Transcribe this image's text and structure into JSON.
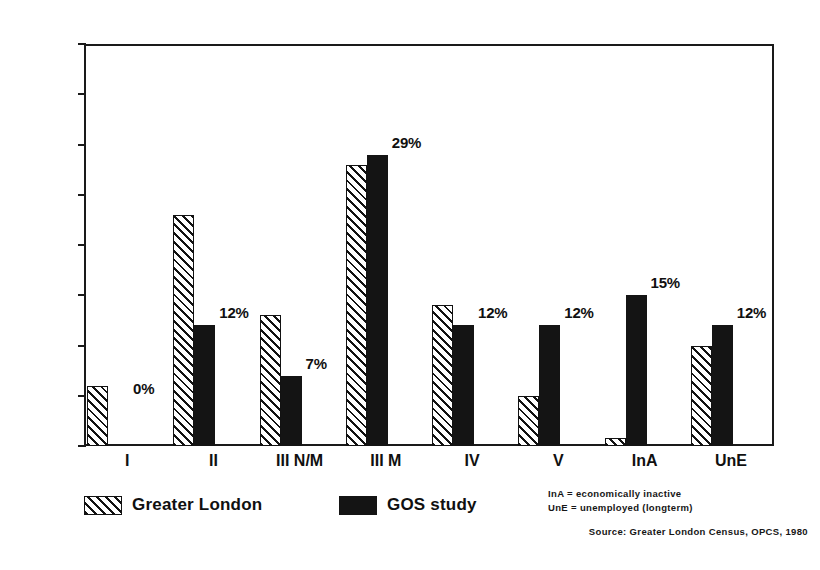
{
  "chart_data": {
    "type": "bar",
    "title": "",
    "xlabel": "",
    "ylabel": "",
    "ylim": [
      0,
      40
    ],
    "yticks": [
      0,
      5,
      10,
      15,
      20,
      25,
      30,
      35,
      40
    ],
    "grid": false,
    "legend_position": "bottom-left",
    "categories": [
      "I",
      "II",
      "III N/M",
      "III M",
      "IV",
      "V",
      "InA",
      "UnE"
    ],
    "series": [
      {
        "name": "Greater London",
        "style": "hatched",
        "values": [
          6,
          23,
          13,
          28,
          14,
          5,
          0.8,
          10
        ]
      },
      {
        "name": "GOS study",
        "style": "solid-black",
        "values": [
          0,
          12,
          7,
          29,
          12,
          12,
          15,
          12
        ]
      }
    ],
    "data_labels": [
      "0%",
      "12%",
      "7%",
      "29%",
      "12%",
      "12%",
      "15%",
      "12%"
    ],
    "notes": [
      "InA = economically inactive",
      "UnE = unemployed (longterm)"
    ],
    "source": "Source: Greater London Census, OPCS, 1980",
    "colors": {
      "ink": "#141414",
      "background": "#ffffff",
      "hatch": "#121212",
      "solid": "#141414"
    }
  }
}
